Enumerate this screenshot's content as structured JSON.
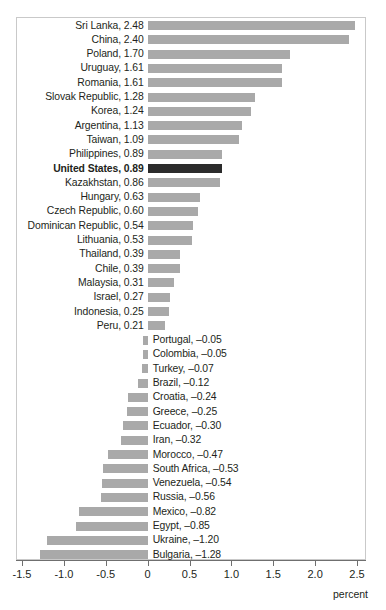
{
  "chart_data": {
    "type": "bar",
    "orientation": "horizontal",
    "title": "",
    "subtitle": "",
    "xlabel": "percent",
    "ylabel": "",
    "xlim": [
      -1.5,
      2.5
    ],
    "xticks": [
      -1.5,
      -1.0,
      -0.5,
      0,
      0.5,
      1.0,
      1.5,
      2.0,
      2.5
    ],
    "xtick_labels": [
      "-1.5",
      "-1.0",
      "-0.5",
      "0",
      "0.5",
      "1.0",
      "1.5",
      "2.0",
      "2.5"
    ],
    "grid": false,
    "legend": null,
    "highlight_category": "United States",
    "colors": {
      "bar": "#a9a9a9",
      "bar_highlight": "#2b2b2b",
      "frame": "#c9c9c9",
      "axis": "#6f6f6f",
      "text": "#231f20"
    },
    "categories": [
      "Sri Lanka",
      "China",
      "Poland",
      "Uruguay",
      "Romania",
      "Slovak Republic",
      "Korea",
      "Argentina",
      "Taiwan",
      "Philippines",
      "United States",
      "Kazakhstan",
      "Hungary",
      "Czech Republic",
      "Dominican Republic",
      "Lithuania",
      "Thailand",
      "Chile",
      "Malaysia",
      "Israel",
      "Indonesia",
      "Peru",
      "Portugal",
      "Colombia",
      "Turkey",
      "Brazil",
      "Croatia",
      "Greece",
      "Ecuador",
      "Iran",
      "Morocco",
      "South Africa",
      "Venezuela",
      "Russia",
      "Mexico",
      "Egypt",
      "Ukraine",
      "Bulgaria"
    ],
    "values": [
      2.48,
      2.4,
      1.7,
      1.61,
      1.61,
      1.28,
      1.24,
      1.13,
      1.09,
      0.89,
      0.89,
      0.86,
      0.63,
      0.6,
      0.54,
      0.53,
      0.39,
      0.39,
      0.31,
      0.27,
      0.25,
      0.21,
      -0.05,
      -0.05,
      -0.07,
      -0.12,
      -0.24,
      -0.25,
      -0.3,
      -0.32,
      -0.47,
      -0.53,
      -0.54,
      -0.56,
      -0.82,
      -0.85,
      -1.2,
      -1.28
    ],
    "rows": [
      {
        "label": "Sri Lanka, 2.48",
        "category": "Sri Lanka",
        "value": 2.48,
        "highlight": false
      },
      {
        "label": "China, 2.40",
        "category": "China",
        "value": 2.4,
        "highlight": false
      },
      {
        "label": "Poland, 1.70",
        "category": "Poland",
        "value": 1.7,
        "highlight": false
      },
      {
        "label": "Uruguay, 1.61",
        "category": "Uruguay",
        "value": 1.61,
        "highlight": false
      },
      {
        "label": "Romania, 1.61",
        "category": "Romania",
        "value": 1.61,
        "highlight": false
      },
      {
        "label": "Slovak Republic, 1.28",
        "category": "Slovak Republic",
        "value": 1.28,
        "highlight": false
      },
      {
        "label": "Korea, 1.24",
        "category": "Korea",
        "value": 1.24,
        "highlight": false
      },
      {
        "label": "Argentina, 1.13",
        "category": "Argentina",
        "value": 1.13,
        "highlight": false
      },
      {
        "label": "Taiwan, 1.09",
        "category": "Taiwan",
        "value": 1.09,
        "highlight": false
      },
      {
        "label": "Philippines, 0.89",
        "category": "Philippines",
        "value": 0.89,
        "highlight": false
      },
      {
        "label": "United States, 0.89",
        "category": "United States",
        "value": 0.89,
        "highlight": true
      },
      {
        "label": "Kazakhstan, 0.86",
        "category": "Kazakhstan",
        "value": 0.86,
        "highlight": false
      },
      {
        "label": "Hungary, 0.63",
        "category": "Hungary",
        "value": 0.63,
        "highlight": false
      },
      {
        "label": "Czech Republic, 0.60",
        "category": "Czech Republic",
        "value": 0.6,
        "highlight": false
      },
      {
        "label": "Dominican Republic, 0.54",
        "category": "Dominican Republic",
        "value": 0.54,
        "highlight": false
      },
      {
        "label": "Lithuania, 0.53",
        "category": "Lithuania",
        "value": 0.53,
        "highlight": false
      },
      {
        "label": "Thailand, 0.39",
        "category": "Thailand",
        "value": 0.39,
        "highlight": false
      },
      {
        "label": "Chile, 0.39",
        "category": "Chile",
        "value": 0.39,
        "highlight": false
      },
      {
        "label": "Malaysia, 0.31",
        "category": "Malaysia",
        "value": 0.31,
        "highlight": false
      },
      {
        "label": "Israel, 0.27",
        "category": "Israel",
        "value": 0.27,
        "highlight": false
      },
      {
        "label": "Indonesia, 0.25",
        "category": "Indonesia",
        "value": 0.25,
        "highlight": false
      },
      {
        "label": "Peru, 0.21",
        "category": "Peru",
        "value": 0.21,
        "highlight": false
      },
      {
        "label": "Portugal, –0.05",
        "category": "Portugal",
        "value": -0.05,
        "highlight": false
      },
      {
        "label": "Colombia, –0.05",
        "category": "Colombia",
        "value": -0.05,
        "highlight": false
      },
      {
        "label": "Turkey, –0.07",
        "category": "Turkey",
        "value": -0.07,
        "highlight": false
      },
      {
        "label": "Brazil, –0.12",
        "category": "Brazil",
        "value": -0.12,
        "highlight": false
      },
      {
        "label": "Croatia, –0.24",
        "category": "Croatia",
        "value": -0.24,
        "highlight": false
      },
      {
        "label": "Greece, –0.25",
        "category": "Greece",
        "value": -0.25,
        "highlight": false
      },
      {
        "label": "Ecuador, –0.30",
        "category": "Ecuador",
        "value": -0.3,
        "highlight": false
      },
      {
        "label": "Iran, –0.32",
        "category": "Iran",
        "value": -0.32,
        "highlight": false
      },
      {
        "label": "Morocco, –0.47",
        "category": "Morocco",
        "value": -0.47,
        "highlight": false
      },
      {
        "label": "South Africa, –0.53",
        "category": "South Africa",
        "value": -0.53,
        "highlight": false
      },
      {
        "label": "Venezuela, –0.54",
        "category": "Venezuela",
        "value": -0.54,
        "highlight": false
      },
      {
        "label": "Russia, –0.56",
        "category": "Russia",
        "value": -0.56,
        "highlight": false
      },
      {
        "label": "Mexico, –0.82",
        "category": "Mexico",
        "value": -0.82,
        "highlight": false
      },
      {
        "label": "Egypt, –0.85",
        "category": "Egypt",
        "value": -0.85,
        "highlight": false
      },
      {
        "label": "Ukraine, –1.20",
        "category": "Ukraine",
        "value": -1.2,
        "highlight": false
      },
      {
        "label": "Bulgaria, –1.28",
        "category": "Bulgaria",
        "value": -1.28,
        "highlight": false
      }
    ]
  }
}
